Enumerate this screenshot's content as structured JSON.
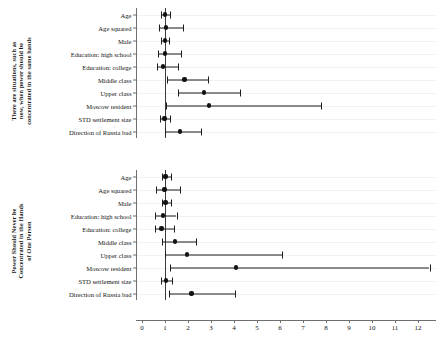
{
  "figure": {
    "type": "forest-plot",
    "width": 442,
    "height": 340,
    "background": "#ffffff",
    "point_color": "#111111",
    "line_color": "#1d1d1d",
    "reference_line_value": 1
  },
  "xaxis": {
    "ticks": [
      0,
      1,
      2,
      3,
      4,
      5,
      6,
      7,
      8,
      9,
      10,
      11,
      12
    ],
    "labels": [
      "0",
      "1",
      "2",
      "3",
      "4",
      "5",
      "6",
      "7",
      "8",
      "9",
      "10",
      "11",
      "12"
    ],
    "min": -0.25,
    "max": 12.9,
    "label": ""
  },
  "panels": [
    {
      "id": "panel-top",
      "title_lines": [
        "There are situations, such as",
        "now, when power should be",
        "concentrated in the same hands"
      ]
    },
    {
      "id": "panel-bottom",
      "title_lines": [
        "Power Should Never be",
        "Concentrated in the Hands",
        "of One Person"
      ]
    }
  ],
  "chart_data": {
    "type": "scatter",
    "title": "",
    "subtitle": "",
    "xlabel": "",
    "ylabel": "",
    "xlim": [
      -0.25,
      12.9
    ],
    "grid": true,
    "legend": "none",
    "reference_line": 1,
    "value_type": "odds ratio",
    "categories": [
      "Age",
      "Age squared",
      "Male",
      "Education: high school",
      "Education: college",
      "Middle class",
      "Upper class",
      "Moscow resident",
      "STD settlement size",
      "Direction of Russia bad"
    ],
    "series": [
      {
        "name": "There are situations, such as now, when power should be concentrated in the same hands",
        "points": [
          {
            "category": "Age",
            "estimate": 1.0,
            "ci_low": 0.82,
            "ci_high": 1.2
          },
          {
            "category": "Age squared",
            "estimate": 1.05,
            "ci_low": 0.73,
            "ci_high": 1.78
          },
          {
            "category": "Male",
            "estimate": 0.99,
            "ci_low": 0.83,
            "ci_high": 1.17
          },
          {
            "category": "Education: high school",
            "estimate": 1.0,
            "ci_low": 0.7,
            "ci_high": 1.7
          },
          {
            "category": "Education: college",
            "estimate": 0.93,
            "ci_low": 0.65,
            "ci_high": 1.55
          },
          {
            "category": "Middle class",
            "estimate": 1.85,
            "ci_low": 1.08,
            "ci_high": 2.85
          },
          {
            "category": "Upper class",
            "estimate": 2.7,
            "ci_low": 1.55,
            "ci_high": 4.25
          },
          {
            "category": "Moscow resident",
            "estimate": 2.9,
            "ci_low": 1.03,
            "ci_high": 7.8
          },
          {
            "category": "STD settlement size",
            "estimate": 0.98,
            "ci_low": 0.8,
            "ci_high": 1.22
          },
          {
            "category": "Direction of Russia bad",
            "estimate": 1.65,
            "ci_low": 1.02,
            "ci_high": 2.55
          }
        ]
      },
      {
        "name": "Power Should Never be Concentrated in the Hands of One Person",
        "points": [
          {
            "category": "Age",
            "estimate": 1.02,
            "ci_low": 0.85,
            "ci_high": 1.25
          },
          {
            "category": "Age squared",
            "estimate": 0.98,
            "ci_low": 0.62,
            "ci_high": 1.65
          },
          {
            "category": "Male",
            "estimate": 1.02,
            "ci_low": 0.85,
            "ci_high": 1.25
          },
          {
            "category": "Education: high school",
            "estimate": 0.9,
            "ci_low": 0.58,
            "ci_high": 1.5
          },
          {
            "category": "Education: college",
            "estimate": 0.85,
            "ci_low": 0.58,
            "ci_high": 1.4
          },
          {
            "category": "Middle class",
            "estimate": 1.45,
            "ci_low": 0.88,
            "ci_high": 2.35
          },
          {
            "category": "Upper class",
            "estimate": 1.95,
            "ci_low": 1.02,
            "ci_high": 6.1
          },
          {
            "category": "Moscow resident",
            "estimate": 4.1,
            "ci_low": 1.22,
            "ci_high": 12.5
          },
          {
            "category": "STD settlement size",
            "estimate": 1.05,
            "ci_low": 0.83,
            "ci_high": 1.3
          },
          {
            "category": "Direction of Russia bad",
            "estimate": 2.15,
            "ci_low": 1.18,
            "ci_high": 4.05
          }
        ]
      }
    ]
  }
}
